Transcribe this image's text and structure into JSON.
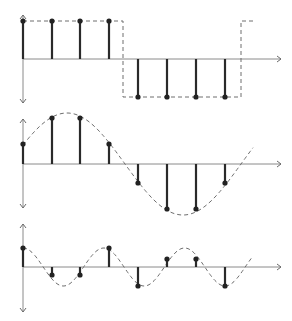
{
  "figure": {
    "colors": {
      "stem": "#2a2a2a",
      "axis": "#8a8a8a",
      "curve": "#6e6e6e",
      "background": "#ffffff"
    },
    "sample_x": [
      23,
      52,
      80,
      109,
      138,
      167,
      196,
      225
    ],
    "axis": {
      "x_start": 23,
      "x_end": 281
    },
    "panels": [
      {
        "name": "square-wave",
        "baseline_y": 59,
        "y_top": 15,
        "y_bottom": 103,
        "sample_y": [
          21,
          21,
          21,
          21,
          97,
          97,
          97,
          97
        ],
        "curve_type": "square",
        "square": {
          "high_y": 21,
          "low_y": 97,
          "fall_x": 123,
          "rise_x": 241,
          "end_x": 253
        }
      },
      {
        "name": "sine-wave",
        "baseline_y": 164,
        "y_top": 119,
        "y_bottom": 208,
        "sample_y": [
          144,
          118,
          118,
          144,
          183,
          209,
          209,
          183
        ],
        "curve_type": "sine",
        "sine": {
          "amplitude": 51,
          "period": 232,
          "peak_x": 67,
          "x_from": 23,
          "x_to": 253
        }
      },
      {
        "name": "aliased-cosine",
        "baseline_y": 267,
        "y_top": 224,
        "y_bottom": 312,
        "sample_y": [
          248,
          275,
          275,
          248,
          286,
          259,
          259,
          286
        ],
        "curve_type": "sine",
        "sine": {
          "amplitude": 19,
          "period": 80.8,
          "peak_x": 23,
          "x_from": 23,
          "x_to": 253
        }
      }
    ]
  }
}
